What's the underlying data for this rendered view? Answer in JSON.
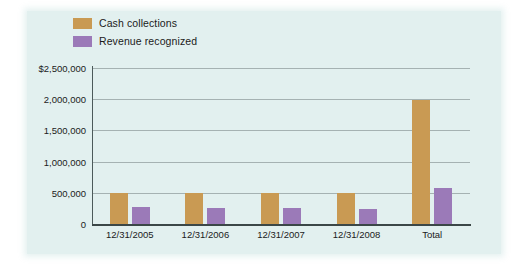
{
  "chart_data": {
    "type": "bar",
    "title": "",
    "xlabel": "",
    "ylabel": "",
    "grid": true,
    "legend_position": "top-left",
    "categories": [
      "12/31/2005",
      "12/31/2006",
      "12/31/2007",
      "12/31/2008",
      "Total"
    ],
    "ytick_labels": [
      "$2,500,000",
      "2,000,000",
      "1,500,000",
      "1,000,000",
      "500,000",
      "0"
    ],
    "ytick_values": [
      2500000,
      2000000,
      1500000,
      1000000,
      500000,
      0
    ],
    "ylim": [
      0,
      2500000
    ],
    "series": [
      {
        "name": "Cash collections",
        "color": "#c99a53",
        "values": [
          500000,
          500000,
          495000,
          490000,
          1985000
        ]
      },
      {
        "name": "Revenue recognized",
        "color": "#9b7ab8",
        "values": [
          265000,
          255000,
          250000,
          240000,
          580000
        ]
      }
    ]
  },
  "legend": {
    "items": [
      {
        "label": "Cash collections",
        "color": "#c99a53"
      },
      {
        "label": "Revenue recognized",
        "color": "#9b7ab8"
      }
    ]
  },
  "colors": {
    "panel_background": "#e2f0ef",
    "page_background": "#ffffff",
    "gridline": "#9aa7a7",
    "axis": "#3b4747",
    "text": "#1b1b1b"
  }
}
